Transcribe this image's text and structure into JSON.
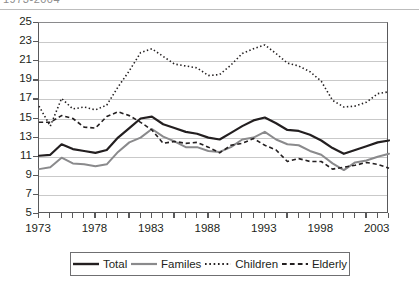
{
  "title_strip": {
    "text": "1973-2004"
  },
  "chart_data": {
    "type": "line",
    "title": "",
    "subtitle": "",
    "xlabel": "",
    "ylabel": "",
    "xlim": [
      1973,
      2004
    ],
    "ylim": [
      5,
      25
    ],
    "grid": "horizontal",
    "legend_position": "bottom",
    "x": [
      1973,
      1974,
      1975,
      1976,
      1977,
      1978,
      1979,
      1980,
      1981,
      1982,
      1983,
      1984,
      1985,
      1986,
      1987,
      1988,
      1989,
      1990,
      1991,
      1992,
      1993,
      1994,
      1995,
      1996,
      1997,
      1998,
      1999,
      2000,
      2001,
      2002,
      2003,
      2004
    ],
    "y_ticks": [
      5,
      7,
      9,
      11,
      13,
      15,
      17,
      19,
      21,
      23,
      25
    ],
    "x_ticks_labeled": [
      1973,
      1978,
      1983,
      1988,
      1993,
      1998,
      2003
    ],
    "series": [
      {
        "name": "Total",
        "style": "solid",
        "color": "#231f20",
        "width": 2.2,
        "values": [
          11.1,
          11.2,
          12.3,
          11.8,
          11.6,
          11.4,
          11.7,
          13.0,
          14.0,
          15.0,
          15.2,
          14.4,
          14.0,
          13.6,
          13.4,
          13.0,
          12.8,
          13.5,
          14.2,
          14.8,
          15.1,
          14.5,
          13.8,
          13.7,
          13.3,
          12.7,
          11.9,
          11.3,
          11.7,
          12.1,
          12.5,
          12.7
        ]
      },
      {
        "name": "Familes",
        "style": "solid",
        "color": "#8a8a8c",
        "width": 2.0,
        "values": [
          9.7,
          9.9,
          10.9,
          10.3,
          10.2,
          10.0,
          10.2,
          11.5,
          12.5,
          13.0,
          13.9,
          13.1,
          12.6,
          12.0,
          12.0,
          11.6,
          11.5,
          12.0,
          12.8,
          13.0,
          13.6,
          12.8,
          12.3,
          12.2,
          11.6,
          11.2,
          10.3,
          9.6,
          10.4,
          10.6,
          11.0,
          11.3
        ]
      },
      {
        "name": "Children",
        "style": "dotted",
        "color": "#231f20",
        "width": 1.6,
        "values": [
          16.3,
          14.2,
          17.1,
          16.0,
          16.2,
          15.9,
          16.4,
          18.3,
          20.0,
          21.9,
          22.3,
          21.5,
          20.7,
          20.5,
          20.3,
          19.5,
          19.6,
          20.6,
          21.8,
          22.3,
          22.7,
          21.8,
          20.8,
          20.5,
          19.9,
          18.9,
          16.9,
          16.2,
          16.3,
          16.7,
          17.6,
          17.8
        ]
      },
      {
        "name": "Elderly",
        "style": "dashed",
        "color": "#231f20",
        "width": 1.6,
        "values": [
          14.6,
          14.6,
          15.3,
          15.0,
          14.1,
          14.0,
          15.2,
          15.7,
          15.3,
          14.6,
          13.8,
          12.4,
          12.6,
          12.4,
          12.5,
          12.0,
          11.4,
          12.2,
          12.4,
          12.9,
          12.2,
          11.7,
          10.5,
          10.8,
          10.5,
          10.5,
          9.7,
          9.9,
          10.1,
          10.4,
          10.2,
          9.8
        ]
      }
    ]
  },
  "legend": {
    "items": [
      {
        "label": "Total",
        "style": "solid",
        "color": "#231f20",
        "width": 2.4
      },
      {
        "label": "Familes",
        "style": "solid",
        "color": "#8a8a8c",
        "width": 2.2
      },
      {
        "label": "Children",
        "style": "dotted",
        "color": "#231f20",
        "width": 1.8
      },
      {
        "label": "Elderly",
        "style": "dashed",
        "color": "#231f20",
        "width": 1.8
      }
    ]
  }
}
